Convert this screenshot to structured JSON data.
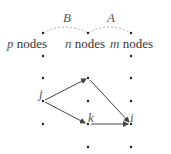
{
  "arcs": [
    {
      "label": "B",
      "from": "p",
      "to": "n"
    },
    {
      "label": "A",
      "from": "n",
      "to": "m"
    }
  ],
  "groups": [
    {
      "var": "p",
      "word": "nodes"
    },
    {
      "var": "n",
      "word": "nodes"
    },
    {
      "var": "m",
      "word": "nodes"
    }
  ],
  "node_labels": {
    "j": "j",
    "k": "k",
    "i": "i"
  },
  "edges": [
    {
      "from": "j",
      "to": "top-middle"
    },
    {
      "from": "j",
      "to": "k"
    },
    {
      "from": "top-middle",
      "to": "i"
    },
    {
      "from": "k",
      "to": "i"
    }
  ],
  "colors": {
    "dot": "#222222",
    "edge": "#444444",
    "arc": "#999999",
    "label": "#555555"
  }
}
